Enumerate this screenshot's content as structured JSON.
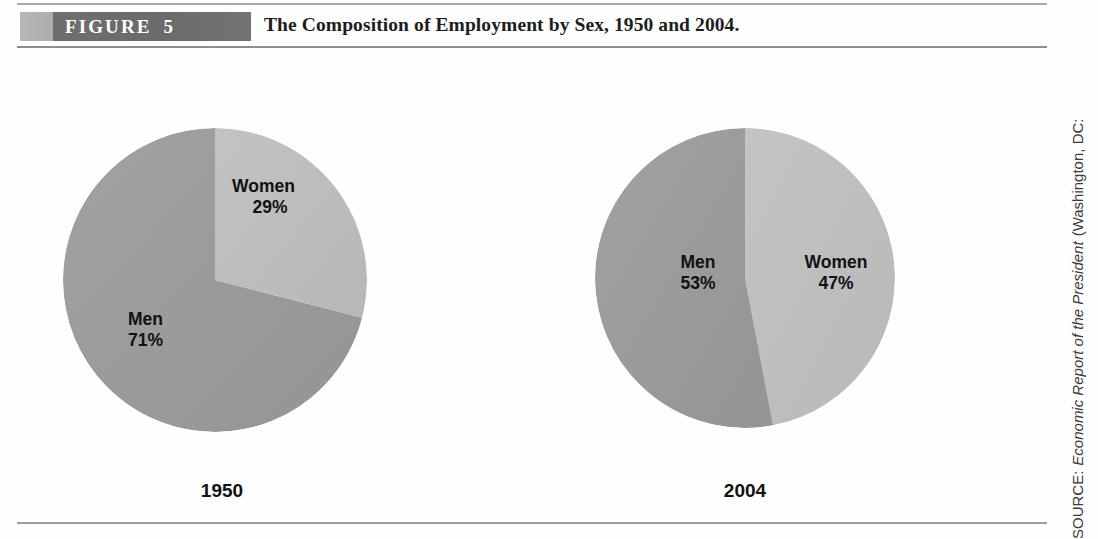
{
  "figure": {
    "badge_label": "FIGURE",
    "badge_number": "5",
    "title": "The Composition of Employment by Sex, 1950 and 2004."
  },
  "source_note": {
    "lead": "SOURCE:",
    "work": "Economic Report of the President",
    "tail": "(Washington, DC:"
  },
  "colors": {
    "men_slice": "#9a9a9a",
    "women_slice": "#bdbdbd",
    "banner_dark": "#6e6e6e",
    "banner_light": "#b6b6b6",
    "rule": "#9d9d9d",
    "label_text": "#111111"
  },
  "chart_data": [
    {
      "type": "pie",
      "title": "1950",
      "labels": [
        "Men",
        "Women"
      ],
      "values": [
        71,
        29
      ],
      "value_labels": [
        "71%",
        "29%"
      ],
      "unit": "%",
      "colors": [
        "#9a9a9a",
        "#bdbdbd"
      ],
      "start_angle_deg": 0,
      "direction": "clockwise",
      "legend": "none",
      "grid": false
    },
    {
      "type": "pie",
      "title": "2004",
      "labels": [
        "Men",
        "Women"
      ],
      "values": [
        53,
        47
      ],
      "value_labels": [
        "53%",
        "47%"
      ],
      "unit": "%",
      "colors": [
        "#9a9a9a",
        "#bdbdbd"
      ],
      "start_angle_deg": 0,
      "direction": "clockwise",
      "legend": "none",
      "grid": false
    }
  ],
  "pies": [
    {
      "year": "1950",
      "men_name": "Men",
      "men_value": "71%",
      "women_name": "Women",
      "women_value": "29%"
    },
    {
      "year": "2004",
      "men_name": "Men",
      "men_value": "53%",
      "women_name": "Women",
      "women_value": "47%"
    }
  ]
}
